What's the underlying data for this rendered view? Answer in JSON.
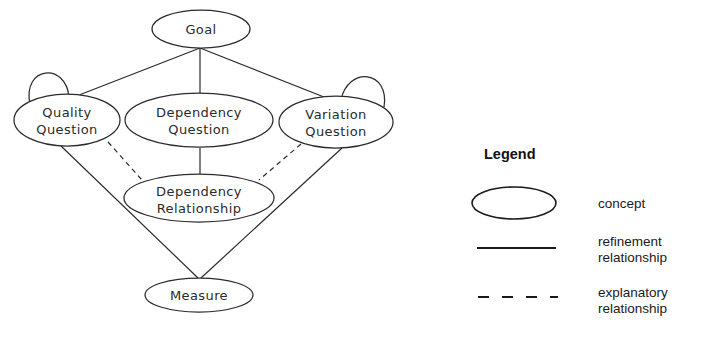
{
  "diagram": {
    "nodes": [
      {
        "id": "goal",
        "label": "Goal",
        "line1": "Goal",
        "line2": "",
        "cx": 201,
        "cy": 29,
        "rx": 49,
        "ry": 19,
        "self_loop": false
      },
      {
        "id": "quality",
        "label": "Quality Question",
        "line1": "Quality",
        "line2": "Question",
        "cx": 67,
        "cy": 120,
        "rx": 53,
        "ry": 26,
        "self_loop": true
      },
      {
        "id": "dependencyq",
        "label": "Dependency Question",
        "line1": "Dependency",
        "line2": "Question",
        "cx": 199,
        "cy": 120,
        "rx": 74,
        "ry": 27,
        "self_loop": false
      },
      {
        "id": "variation",
        "label": "Variation Question",
        "line1": "Variation",
        "line2": "Question",
        "cx": 336,
        "cy": 122,
        "rx": 57,
        "ry": 26,
        "self_loop": true
      },
      {
        "id": "dependencyr",
        "label": "Dependency Relationship",
        "line1": "Dependency",
        "line2": "Relationship",
        "cx": 199,
        "cy": 198,
        "rx": 75,
        "ry": 24,
        "self_loop": false
      },
      {
        "id": "measure",
        "label": "Measure",
        "line1": "Measure",
        "line2": "",
        "cx": 199,
        "cy": 295,
        "rx": 54,
        "ry": 17,
        "self_loop": false
      }
    ],
    "edges": [
      {
        "from": "goal",
        "to": "quality",
        "kind": "refinement"
      },
      {
        "from": "goal",
        "to": "dependencyq",
        "kind": "refinement"
      },
      {
        "from": "goal",
        "to": "variation",
        "kind": "refinement"
      },
      {
        "from": "dependencyq",
        "to": "dependencyr",
        "kind": "refinement"
      },
      {
        "from": "quality",
        "to": "measure",
        "kind": "refinement"
      },
      {
        "from": "variation",
        "to": "measure",
        "kind": "refinement"
      },
      {
        "from": "quality",
        "to": "dependencyr",
        "kind": "explanatory"
      },
      {
        "from": "variation",
        "to": "dependencyr",
        "kind": "explanatory"
      }
    ]
  },
  "legend": {
    "title": "Legend",
    "items": [
      {
        "symbol": "ellipse",
        "label_line1": "concept",
        "label_line2": ""
      },
      {
        "symbol": "solid-line",
        "label_line1": "refinement",
        "label_line2": "relationship"
      },
      {
        "symbol": "dashed-line",
        "label_line1": "explanatory",
        "label_line2": "relationship"
      }
    ]
  },
  "colors": {
    "background": "#ffffff",
    "stroke": "#2b2b2b",
    "legend_stroke": "#1a1a1a",
    "text": "#1a1a1a"
  }
}
